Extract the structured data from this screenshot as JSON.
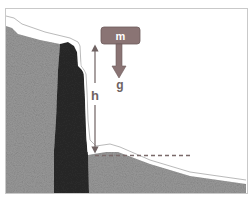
{
  "diagram": {
    "mass_label": "m",
    "gravity_label": "g",
    "height_label": "h",
    "colors": {
      "frame": "#c9c9c9",
      "sky": "#ffffff",
      "rock_light": "#9a9a9a",
      "rock_dark": "#2b2b2b",
      "mass_box": "#8a7474",
      "mass_box_border": "#6d5c5c",
      "arrow": "#8a7474",
      "dashed_line": "#7a6a6a",
      "snow_outline": "#a8a8a8"
    }
  }
}
